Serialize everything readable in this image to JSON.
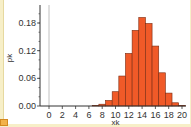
{
  "chart_data": {
    "type": "bar",
    "title": "",
    "xlabel": "xk",
    "ylabel": "pk",
    "x_ticks": [
      "0",
      "2",
      "4",
      "6",
      "8",
      "10",
      "12",
      "14",
      "16",
      "18",
      "20"
    ],
    "y_ticks": [
      "0.00",
      "0.06",
      "0.12",
      "0.18"
    ],
    "xlim": [
      -1,
      21
    ],
    "ylim": [
      0,
      0.2
    ],
    "grid": false,
    "legend": null,
    "bar_color": "#f05a28",
    "bar_edge_color": "#7a2a10",
    "categories": [
      0,
      1,
      2,
      3,
      4,
      5,
      6,
      7,
      8,
      9,
      10,
      11,
      12,
      13,
      14,
      15,
      16,
      17,
      18,
      19,
      20
    ],
    "values": [
      0,
      0,
      0,
      0,
      0,
      4e-05,
      0.0002,
      0.001,
      0.0039,
      0.012,
      0.031,
      0.065,
      0.114,
      0.164,
      0.192,
      0.179,
      0.13,
      0.072,
      0.028,
      0.007,
      0.0008
    ]
  },
  "labels": {
    "xlabel": "xk",
    "ylabel": "pk"
  }
}
